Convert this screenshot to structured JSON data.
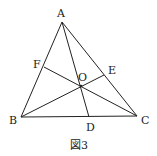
{
  "figure": {
    "caption": "図3",
    "points": {
      "A": {
        "label": "A",
        "x": 62,
        "y": 22,
        "lx": 57,
        "ly": 17
      },
      "B": {
        "label": "B",
        "x": 21,
        "y": 117,
        "lx": 9,
        "ly": 124
      },
      "C": {
        "label": "C",
        "x": 137,
        "y": 116,
        "lx": 141,
        "ly": 124
      },
      "D": {
        "label": "D",
        "x": 89,
        "y": 117,
        "lx": 86,
        "ly": 131
      },
      "E": {
        "label": "E",
        "x": 104,
        "y": 75,
        "lx": 108,
        "ly": 74
      },
      "F": {
        "label": "F",
        "x": 44,
        "y": 67,
        "lx": 33,
        "ly": 68
      },
      "O": {
        "label": "O",
        "x": 81,
        "y": 86,
        "lx": 78,
        "ly": 81
      }
    },
    "segments": [
      [
        "A",
        "B"
      ],
      [
        "B",
        "C"
      ],
      [
        "C",
        "A"
      ],
      [
        "A",
        "D"
      ],
      [
        "B",
        "E"
      ],
      [
        "C",
        "F"
      ]
    ]
  }
}
